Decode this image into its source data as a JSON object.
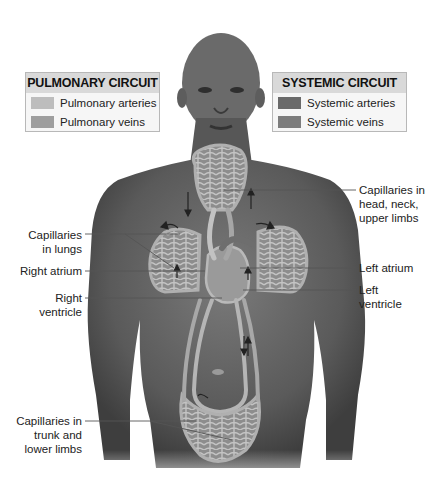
{
  "figure": {
    "colors": {
      "pulmonary_arteries": "#bdbdbd",
      "pulmonary_veins": "#9e9e9e",
      "systemic_arteries": "#6a6a6a",
      "systemic_veins": "#7d7d7d",
      "skin": "#5e5e5e",
      "vessel": "#a9a9a9",
      "capillary": "#8a8a8a"
    }
  },
  "legend_pulmonary": {
    "title": "PULMONARY CIRCUIT",
    "items": [
      {
        "label": "Pulmonary arteries"
      },
      {
        "label": "Pulmonary veins"
      }
    ]
  },
  "legend_systemic": {
    "title": "SYSTEMIC CIRCUIT",
    "items": [
      {
        "label": "Systemic arteries"
      },
      {
        "label": "Systemic veins"
      }
    ]
  },
  "labels": {
    "cap_head_1": "Capillaries in",
    "cap_head_2": "head, neck,",
    "cap_head_3": "upper limbs",
    "left_atrium": "Left atrium",
    "left_ventricle_1": "Left",
    "left_ventricle_2": "ventricle",
    "cap_lungs_1": "Capillaries",
    "cap_lungs_2": "in lungs",
    "right_atrium": "Right atrium",
    "right_ventricle_1": "Right",
    "right_ventricle_2": "ventricle",
    "cap_trunk_1": "Capillaries in",
    "cap_trunk_2": "trunk and",
    "cap_trunk_3": "lower limbs"
  }
}
